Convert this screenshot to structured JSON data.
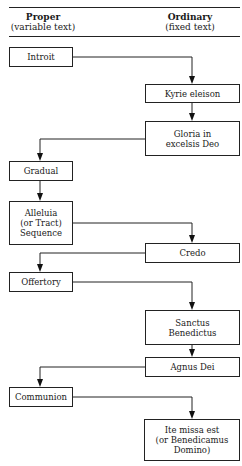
{
  "header": {
    "left": {
      "title": "Proper",
      "subtitle": "(variable text)"
    },
    "right": {
      "title": "Ordinary",
      "subtitle": "(fixed text)"
    }
  },
  "nodes": [
    {
      "id": "introit",
      "column": "proper",
      "label": "Introit"
    },
    {
      "id": "kyrie",
      "column": "ordinary",
      "label": "Kyrie eleison"
    },
    {
      "id": "gloria",
      "column": "ordinary",
      "label": "Gloria in excelsis Deo"
    },
    {
      "id": "gradual",
      "column": "proper",
      "label": "Gradual"
    },
    {
      "id": "alleluia",
      "column": "proper",
      "label": "Alleluia (or Tract) Sequence"
    },
    {
      "id": "credo",
      "column": "ordinary",
      "label": "Credo"
    },
    {
      "id": "offertory",
      "column": "proper",
      "label": "Offertory"
    },
    {
      "id": "sanctus",
      "column": "ordinary",
      "label": "Sanctus Benedictus"
    },
    {
      "id": "agnus",
      "column": "ordinary",
      "label": "Agnus Dei"
    },
    {
      "id": "communion",
      "column": "proper",
      "label": "Communion"
    },
    {
      "id": "ite",
      "column": "ordinary",
      "label": "Ite missa est (or Benedicamus Domino)"
    }
  ],
  "edges": [
    [
      "introit",
      "kyrie"
    ],
    [
      "kyrie",
      "gloria"
    ],
    [
      "gloria",
      "gradual"
    ],
    [
      "gradual",
      "alleluia"
    ],
    [
      "alleluia",
      "credo"
    ],
    [
      "credo",
      "offertory"
    ],
    [
      "offertory",
      "sanctus"
    ],
    [
      "sanctus",
      "agnus"
    ],
    [
      "agnus",
      "communion"
    ],
    [
      "communion",
      "ite"
    ]
  ],
  "labels": {
    "introit": "Introit",
    "kyrie": "Kyrie eleison",
    "gloria_1": "Gloria in",
    "gloria_2": "excelsis Deo",
    "gradual": "Gradual",
    "alleluia_1": "Alleluia",
    "alleluia_2": "(or Tract)",
    "alleluia_3": "Sequence",
    "credo": "Credo",
    "offertory": "Offertory",
    "sanctus_1": "Sanctus",
    "sanctus_2": "Benedictus",
    "agnus": "Agnus Dei",
    "communion": "Communion",
    "ite_1": "Ite missa est",
    "ite_2": "(or Benedicamus",
    "ite_3": "Domino)"
  }
}
